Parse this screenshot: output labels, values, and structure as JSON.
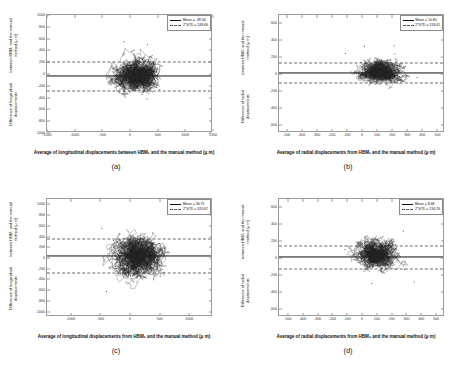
{
  "figure": {
    "panels": [
      {
        "letter": "(a)",
        "legend": {
          "mean_label": "Mean = -39.06",
          "std_label": "2*STD = 248.66"
        },
        "ylabel_line1": "Difference of longitudinal displacements",
        "ylabel_line2": "between HBM₁ and the manual method (μ m)",
        "xlabel": "Average of longitudinal displacements between HBM₁ and the manual method (μ m)",
        "chart_data": {
          "type": "scatter",
          "title": "(a)",
          "xlabel": "Average of longitudinal displacements between HBM₁ and the manual method (μ m)",
          "ylabel": "Difference of longitudinal displacements between HBM₁ and the manual method (μ m)",
          "xlim": [
            -1500,
            1500
          ],
          "ylim": [
            -1000,
            1000
          ],
          "xticks": [
            -1500,
            -1000,
            -500,
            0,
            500,
            1000,
            1500
          ],
          "yticks": [
            1000,
            800,
            600,
            400,
            200,
            0,
            -200,
            -400,
            -600,
            -800,
            -1000
          ],
          "grid": false,
          "legend_position": "upper-right",
          "mean": -39.06,
          "two_std": 248.66,
          "upper_limit": 209.6,
          "lower_limit": -287.72,
          "point_color": "#222222",
          "mean_line_color": "#111111",
          "limit_line_color": "#666666",
          "cloud_x_range": [
            -700,
            1000
          ],
          "cloud_y_range": [
            -430,
            700
          ],
          "n_points_approx": 2600
        }
      },
      {
        "letter": "(b)",
        "legend": {
          "mean_label": "Mean = 10.80",
          "std_label": "2*STD = 118.41"
        },
        "ylabel_line1": "Difference of radial displacements",
        "ylabel_line2": "between HBM₁ and the manual method (μ m)",
        "xlabel": "Average of radial displacements from HBM₁ and the manual method (μ m)",
        "chart_data": {
          "type": "scatter",
          "title": "(b)",
          "xlabel": "Average of radial displacements from HBM₁ and the manual method (μ m)",
          "ylabel": "Difference of radial displacements between HBM₁ and the manual method (μ m)",
          "xlim": [
            -550,
            550
          ],
          "ylim": [
            -700,
            700
          ],
          "xticks": [
            -500,
            -400,
            -300,
            -200,
            -100,
            0,
            100,
            200,
            300,
            400,
            500
          ],
          "yticks": [
            600,
            400,
            200,
            0,
            -200,
            -400,
            -600
          ],
          "grid": false,
          "legend_position": "upper-right",
          "mean": 10.8,
          "two_std": 118.41,
          "upper_limit": 129.21,
          "lower_limit": -107.61,
          "point_color": "#222222",
          "mean_line_color": "#111111",
          "limit_line_color": "#666666",
          "cloud_x_range": [
            -170,
            400
          ],
          "cloud_y_range": [
            -330,
            330
          ],
          "n_points_approx": 2400
        }
      },
      {
        "letter": "(c)",
        "legend": {
          "mean_label": "Mean = 36.75",
          "std_label": "2*STD = 320.67"
        },
        "ylabel_line1": "Difference of longitudinal displacements",
        "ylabel_line2": "between HBM₂ and the manual method (μ m)",
        "xlabel": "Average of longitudinal displacements from HBM₂ and the manual method (μ m)",
        "chart_data": {
          "type": "scatter",
          "title": "(c)",
          "xlabel": "Average of longitudinal displacements from HBM₂ and the manual method (μ m)",
          "ylabel": "Difference of longitudinal displacements between HBM₂ and the manual method (μ m)",
          "xlim": [
            -1400,
            1400
          ],
          "ylim": [
            -1100,
            1100
          ],
          "xticks": [
            -1000,
            -500,
            0,
            500,
            1000
          ],
          "yticks": [
            1000,
            800,
            600,
            400,
            200,
            0,
            -200,
            -400,
            -600,
            -800,
            -1000
          ],
          "grid": false,
          "legend_position": "upper-right",
          "mean": 36.75,
          "two_std": 320.67,
          "upper_limit": 357.42,
          "lower_limit": -283.92,
          "point_color": "#222222",
          "mean_line_color": "#111111",
          "limit_line_color": "#666666",
          "cloud_x_range": [
            -700,
            950
          ],
          "cloud_y_range": [
            -900,
            800
          ],
          "n_points_approx": 2800
        }
      },
      {
        "letter": "(d)",
        "legend": {
          "mean_label": "Mean = 8.68",
          "std_label": "2*STD = 134.76"
        },
        "ylabel_line1": "Difference of radial displacements",
        "ylabel_line2": "between HBM₂ and the manual method (μ m)",
        "xlabel": "Average of radial displacements from HBM₂ and the manual method (μ m)",
        "chart_data": {
          "type": "scatter",
          "title": "(d)",
          "xlabel": "Average of radial displacements from HBM₂ and the manual method (μ m)",
          "ylabel": "Difference of radial displacements between HBM₂ and the manual method (μ m)",
          "xlim": [
            -560,
            560
          ],
          "ylim": [
            -700,
            700
          ],
          "xticks": [
            -500,
            -400,
            -300,
            -200,
            -100,
            0,
            100,
            200,
            300,
            400,
            500
          ],
          "yticks": [
            600,
            400,
            200,
            0,
            -200,
            -400,
            -600
          ],
          "grid": false,
          "legend_position": "upper-right",
          "mean": 8.68,
          "two_std": 134.76,
          "upper_limit": 143.44,
          "lower_limit": -126.08,
          "point_color": "#222222",
          "mean_line_color": "#111111",
          "limit_line_color": "#666666",
          "cloud_x_range": [
            -180,
            390
          ],
          "cloud_y_range": [
            -380,
            260
          ],
          "n_points_approx": 2500
        }
      }
    ]
  }
}
